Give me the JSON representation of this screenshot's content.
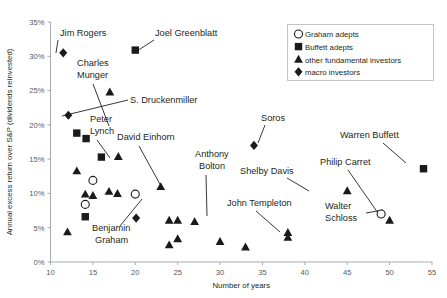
{
  "chart_data": {
    "type": "scatter",
    "title": "",
    "xlabel": "Number of years",
    "ylabel": "Annual excess return over S&P (dividends reinvested)",
    "xlim": [
      10,
      55
    ],
    "ylim": [
      0,
      35
    ],
    "xticks": [
      "10",
      "15",
      "20",
      "25",
      "30",
      "35",
      "40",
      "45",
      "50",
      "55"
    ],
    "xtick_values": [
      10,
      15,
      20,
      25,
      30,
      35,
      40,
      45,
      50,
      55
    ],
    "yticks": [
      "0%",
      "5%",
      "10%",
      "15%",
      "20%",
      "25%",
      "30%",
      "35%"
    ],
    "ytick_values": [
      0,
      5,
      10,
      15,
      20,
      25,
      30,
      35
    ],
    "grid": false,
    "legend_position": "top-right",
    "legend": [
      {
        "label": "Graham adepts",
        "marker": "open-circle"
      },
      {
        "label": "Buffett adepts",
        "marker": "filled-square"
      },
      {
        "label": "other fundamental investors",
        "marker": "filled-triangle"
      },
      {
        "label": "macro investors",
        "marker": "filled-diamond"
      }
    ],
    "series": [
      {
        "name": "Graham adepts",
        "marker": "open-circle",
        "points": [
          {
            "x": 15.0,
            "y": 11.9
          },
          {
            "x": 14.1,
            "y": 8.4
          },
          {
            "x": 20.0,
            "y": 9.9
          },
          {
            "x": 49.0,
            "y": 7.0
          }
        ]
      },
      {
        "name": "Buffett adepts",
        "marker": "filled-square",
        "points": [
          {
            "x": 20.0,
            "y": 30.9
          },
          {
            "x": 13.1,
            "y": 18.8
          },
          {
            "x": 14.2,
            "y": 18.0
          },
          {
            "x": 16.0,
            "y": 15.3
          },
          {
            "x": 14.1,
            "y": 6.6
          },
          {
            "x": 54.0,
            "y": 13.6
          }
        ]
      },
      {
        "name": "other fundamental investors",
        "marker": "filled-triangle",
        "points": [
          {
            "x": 17.0,
            "y": 24.8
          },
          {
            "x": 18.0,
            "y": 15.4
          },
          {
            "x": 13.1,
            "y": 13.3
          },
          {
            "x": 17.9,
            "y": 10.0
          },
          {
            "x": 14.1,
            "y": 9.9
          },
          {
            "x": 16.9,
            "y": 10.3
          },
          {
            "x": 15.0,
            "y": 9.7
          },
          {
            "x": 12.0,
            "y": 4.4
          },
          {
            "x": 23.0,
            "y": 11.0
          },
          {
            "x": 24.0,
            "y": 6.1
          },
          {
            "x": 25.0,
            "y": 6.1
          },
          {
            "x": 27.0,
            "y": 5.9
          },
          {
            "x": 24.0,
            "y": 2.5
          },
          {
            "x": 25.0,
            "y": 3.4
          },
          {
            "x": 30.0,
            "y": 3.0
          },
          {
            "x": 33.0,
            "y": 2.2
          },
          {
            "x": 38.0,
            "y": 4.3
          },
          {
            "x": 38.0,
            "y": 3.6
          },
          {
            "x": 45.0,
            "y": 10.4
          },
          {
            "x": 50.0,
            "y": 6.1
          }
        ]
      },
      {
        "name": "macro investors",
        "marker": "filled-diamond",
        "points": [
          {
            "x": 11.5,
            "y": 30.5
          },
          {
            "x": 12.1,
            "y": 21.4
          },
          {
            "x": 20.1,
            "y": 6.4
          },
          {
            "x": 34.0,
            "y": 17.0
          }
        ]
      }
    ],
    "annotations": [
      {
        "text": "Jim Rogers",
        "label_x": 60,
        "label_y": 36,
        "anchor": "start",
        "leader": [
          [
            58,
            40
          ],
          [
            56,
            53
          ]
        ]
      },
      {
        "text": "Joel Greenblatt",
        "label_x": 155,
        "label_y": 36,
        "anchor": "start",
        "leader": [
          [
            154,
            40
          ],
          [
            137,
            51
          ]
        ]
      },
      {
        "text": "Charles",
        "label_x": 77,
        "label_y": 66,
        "anchor": "start",
        "leader": null
      },
      {
        "text": "Munger",
        "label_x": 77,
        "label_y": 78,
        "anchor": "start",
        "leader": [
          [
            93,
            84
          ],
          [
            109,
            126
          ]
        ]
      },
      {
        "text": "S. Druckenmiller",
        "label_x": 130,
        "label_y": 103,
        "anchor": "start",
        "leader": [
          [
            128,
            100
          ],
          [
            62,
            116
          ]
        ]
      },
      {
        "text": "Peter",
        "label_x": 90,
        "label_y": 122,
        "anchor": "start",
        "leader": null
      },
      {
        "text": "Lynch",
        "label_x": 90,
        "label_y": 134,
        "anchor": "start",
        "leader": [
          [
            97,
            140
          ],
          [
            110,
            158
          ]
        ]
      },
      {
        "text": "David Einhorn",
        "label_x": 117,
        "label_y": 140,
        "anchor": "start",
        "leader": [
          [
            139,
            146
          ],
          [
            161,
            186
          ]
        ]
      },
      {
        "text": "Anthony",
        "label_x": 195,
        "label_y": 157,
        "anchor": "start",
        "leader": null
      },
      {
        "text": "Bolton",
        "label_x": 199,
        "label_y": 169,
        "anchor": "start",
        "leader": [
          [
            206,
            175
          ],
          [
            207,
            216
          ]
        ]
      },
      {
        "text": "Soros",
        "label_x": 261,
        "label_y": 121,
        "anchor": "start",
        "leader": [
          [
            265,
            125
          ],
          [
            258,
            143
          ]
        ]
      },
      {
        "text": "Warren Buffett",
        "label_x": 340,
        "label_y": 138,
        "anchor": "start",
        "leader": [
          [
            383,
            143
          ],
          [
            406,
            163
          ]
        ]
      },
      {
        "text": "Shelby Davis",
        "label_x": 240,
        "label_y": 174,
        "anchor": "start",
        "leader": [
          [
            287,
            178
          ],
          [
            309,
            191
          ]
        ]
      },
      {
        "text": "Philip Carret",
        "label_x": 320,
        "label_y": 165,
        "anchor": "start",
        "leader": [
          [
            348,
            170
          ],
          [
            378,
            213
          ]
        ]
      },
      {
        "text": "John Templeton",
        "label_x": 227,
        "label_y": 206,
        "anchor": "start",
        "leader": [
          [
            256,
            211
          ],
          [
            280,
            232
          ]
        ]
      },
      {
        "text": "Walter",
        "label_x": 325,
        "label_y": 209,
        "anchor": "start",
        "leader": null
      },
      {
        "text": "Schloss",
        "label_x": 325,
        "label_y": 221,
        "anchor": "start",
        "leader": [
          [
            366,
            213
          ],
          [
            383,
            210
          ]
        ]
      },
      {
        "text": "Benjamin",
        "label_x": 92,
        "label_y": 231,
        "anchor": "start",
        "leader": [
          [
            120,
            226
          ],
          [
            142,
            199
          ]
        ]
      },
      {
        "text": "Graham",
        "label_x": 95,
        "label_y": 243,
        "anchor": "start",
        "leader": null
      }
    ]
  }
}
